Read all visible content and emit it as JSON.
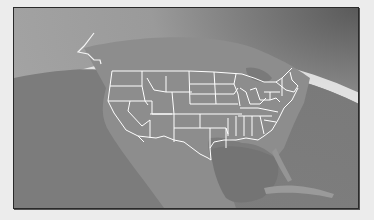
{
  "figure": {
    "kind": "globe-map",
    "region": "United States (contiguous) with Alaska panhandle edge",
    "style": "grayscale",
    "colors": {
      "space": "#8f8f8f",
      "atmosphere_glow": "#f2f2f2",
      "ocean": "#7e7e7e",
      "land": "#8c8c8c",
      "state_borders": "#ffffff",
      "frame_border": "#2a2a2a",
      "page_background": "#ececec"
    }
  }
}
